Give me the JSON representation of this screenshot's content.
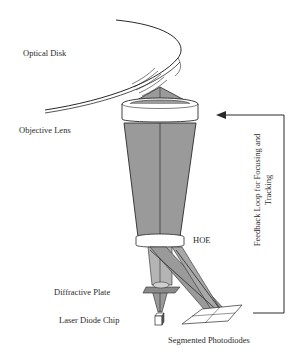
{
  "diagram": {
    "type": "optical pickup schematic",
    "labels": {
      "optical_disk": "Optical Disk",
      "objective_lens": "Objective Lens",
      "hoe": "HOE",
      "diffractive_plate": "Diffractive Plate",
      "laser_diode_chip": "Laser Diode Chip",
      "segmented_photodiodes": "Segmented Photodiodes",
      "feedback_line1": "Feedback Loop for Focusing and",
      "feedback_line2": "Tracking"
    },
    "colors": {
      "line": "#2a2a2a",
      "beam_fill": "#9a9a9a",
      "beam_fill_light": "#b4b4b4",
      "lens_fill": "#ffffff",
      "background": "#ffffff"
    }
  }
}
